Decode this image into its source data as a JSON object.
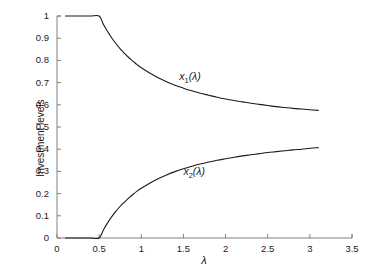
{
  "figure": {
    "background_color": "#ffffff",
    "line_color": "#1a1a1a",
    "axis_color": "#808080"
  },
  "axes": {
    "x_title": "λ",
    "y_title": "Investment levels",
    "x_ticks": [
      "0",
      "0.5",
      "1",
      "1.5",
      "2",
      "2.5",
      "3",
      "3.5"
    ],
    "y_ticks": [
      "0",
      "0.1",
      "0.2",
      "0.3",
      "0.4",
      "0.5",
      "0.6",
      "0.7",
      "0.8",
      "0.9",
      "1"
    ]
  },
  "series_labels": {
    "x1": {
      "var": "x",
      "sub": "1",
      "arg": "(λ)"
    },
    "x2": {
      "var": "x",
      "sub": "2",
      "arg": "(λ)"
    }
  },
  "chart_data": {
    "type": "line",
    "title": "",
    "xlabel": "λ",
    "ylabel": "Investment levels",
    "xlim": [
      0,
      3.5
    ],
    "ylim": [
      0,
      1
    ],
    "xticks": [
      0,
      0.5,
      1,
      1.5,
      2,
      2.5,
      3,
      3.5
    ],
    "yticks": [
      0,
      0.1,
      0.2,
      0.3,
      0.4,
      0.5,
      0.6,
      0.7,
      0.8,
      0.9,
      1
    ],
    "grid": false,
    "legend": "inline-annotations",
    "spines": [
      "left",
      "bottom"
    ],
    "x_data_range": [
      0.1,
      3.1
    ],
    "kink_lambda": 0.5,
    "series": [
      {
        "name": "x1(λ)",
        "label_position": {
          "x": 1.45,
          "y": 0.73
        },
        "x": [
          0.1,
          0.2,
          0.3,
          0.4,
          0.5,
          0.55,
          0.6,
          0.65,
          0.7,
          0.75,
          0.8,
          0.85,
          0.9,
          0.95,
          1.0,
          1.1,
          1.2,
          1.3,
          1.4,
          1.5,
          1.6,
          1.7,
          1.8,
          1.9,
          2.0,
          2.1,
          2.2,
          2.3,
          2.4,
          2.5,
          2.6,
          2.7,
          2.8,
          2.9,
          3.0,
          3.1
        ],
        "y": [
          1.0,
          1.0,
          1.0,
          1.0,
          1.0,
          0.963,
          0.93,
          0.901,
          0.875,
          0.852,
          0.832,
          0.813,
          0.797,
          0.781,
          0.767,
          0.743,
          0.722,
          0.704,
          0.688,
          0.675,
          0.663,
          0.652,
          0.643,
          0.634,
          0.626,
          0.619,
          0.613,
          0.607,
          0.602,
          0.597,
          0.592,
          0.588,
          0.584,
          0.581,
          0.578,
          0.575
        ]
      },
      {
        "name": "x2(λ)",
        "label_position": {
          "x": 1.5,
          "y": 0.3
        },
        "x": [
          0.1,
          0.2,
          0.3,
          0.4,
          0.5,
          0.55,
          0.6,
          0.65,
          0.7,
          0.75,
          0.8,
          0.85,
          0.9,
          0.95,
          1.0,
          1.1,
          1.2,
          1.3,
          1.4,
          1.5,
          1.6,
          1.7,
          1.8,
          1.9,
          2.0,
          2.1,
          2.2,
          2.3,
          2.4,
          2.5,
          2.6,
          2.7,
          2.8,
          2.9,
          3.0,
          3.1
        ],
        "y": [
          0.0,
          0.0,
          0.0,
          0.0,
          0.0,
          0.036,
          0.068,
          0.096,
          0.121,
          0.143,
          0.162,
          0.18,
          0.196,
          0.211,
          0.224,
          0.247,
          0.267,
          0.284,
          0.299,
          0.312,
          0.323,
          0.333,
          0.342,
          0.35,
          0.357,
          0.364,
          0.37,
          0.375,
          0.38,
          0.385,
          0.389,
          0.393,
          0.397,
          0.4,
          0.404,
          0.407
        ]
      }
    ]
  }
}
